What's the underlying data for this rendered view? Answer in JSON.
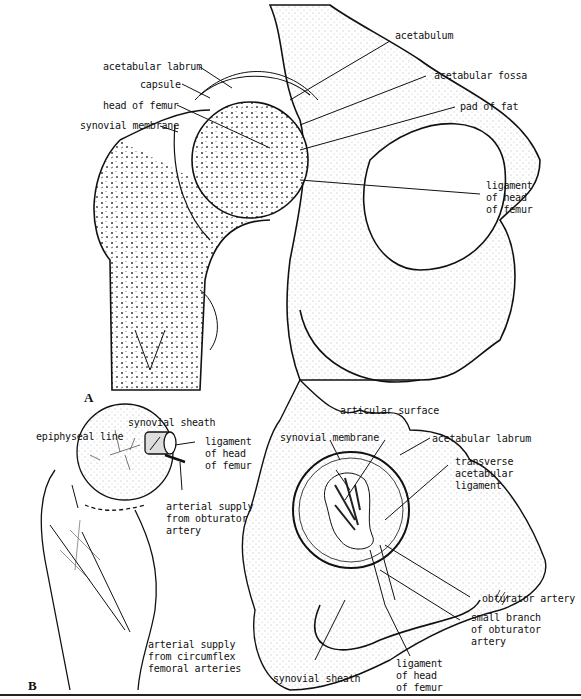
{
  "figure": {
    "panel_a": {
      "letter": "A",
      "labels": {
        "acetabulum": "acetabulum",
        "acetabular_labrum": "acetabular labrum",
        "acetabular_fossa": "acetabular fossa",
        "capsule": "capsule",
        "head_of_femur": "head of femur",
        "pad_of_fat": "pad of fat",
        "synovial_membrane": "synovial membrane",
        "ligament_of_head_of_femur": "ligament\nof head\nof femur"
      }
    },
    "panel_b": {
      "letter": "B",
      "labels": {
        "articular_surface": "articular surface",
        "synovial_sheath_top": "synovial sheath",
        "epiphyseal_line": "epiphyseal line",
        "synovial_membrane": "synovial membrane",
        "acetabular_labrum": "acetabular labrum",
        "ligament_of_head_of_femur_left": "ligament\nof head\nof femur",
        "transverse_acetabular_ligament": "transverse\nacetabular\nligament",
        "arterial_supply_obturator": "arterial supply\nfrom obturator\nartery",
        "obturator_artery": "obturator artery",
        "small_branch_obturator": "small branch\nof obturator\nartery",
        "arterial_supply_circumflex": "arterial supply\nfrom circumflex\nfemoral arteries",
        "ligament_of_head_of_femur_bottom": "ligament\nof head\nof femur",
        "synovial_sheath_bottom": "synovial sheath"
      }
    }
  }
}
